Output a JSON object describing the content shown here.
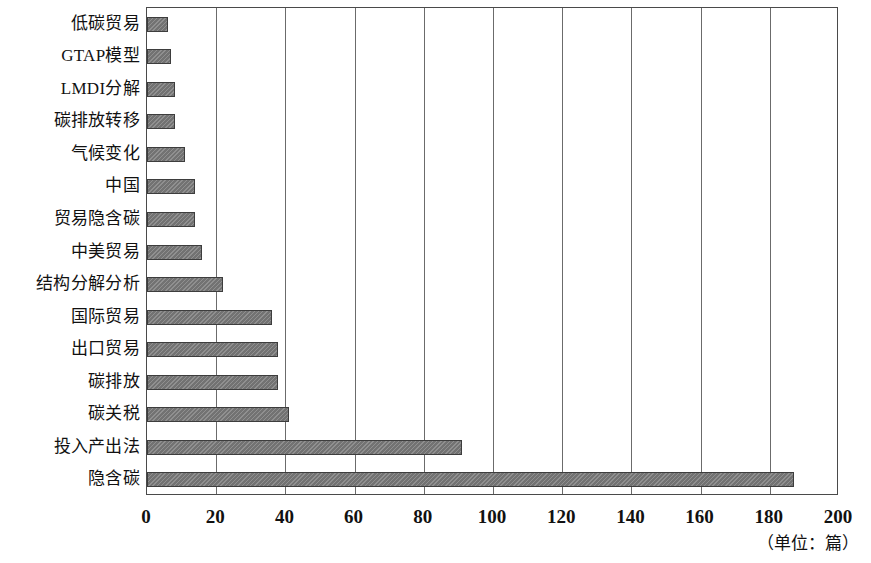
{
  "chart_data": {
    "type": "bar",
    "orientation": "horizontal",
    "title": "",
    "subtitle": "",
    "xlabel": "",
    "ylabel": "",
    "unit_note": "（单位：篇）",
    "xlim": [
      0,
      200
    ],
    "xticks": [
      0,
      20,
      40,
      60,
      80,
      100,
      120,
      140,
      160,
      180,
      200
    ],
    "xtick_labels": [
      "0",
      "20",
      "40",
      "60",
      "80",
      "100",
      "120",
      "140",
      "160",
      "180",
      "200"
    ],
    "grid": true,
    "grid_axis": "x",
    "legend": null,
    "bar_color": "#7b7b7b",
    "bar_edge_color": "#3d3d3d",
    "categories": [
      "低碳贸易",
      "GTAP模型",
      "LMDI分解",
      "碳排放转移",
      "气候变化",
      "中国",
      "贸易隐含碳",
      "中美贸易",
      "结构分解分析",
      "国际贸易",
      "出口贸易",
      "碳排放",
      "碳关税",
      "投入产出法",
      "隐含碳"
    ],
    "values": [
      6,
      7,
      8,
      8,
      11,
      14,
      14,
      16,
      22,
      36,
      38,
      38,
      41,
      91,
      187
    ]
  }
}
